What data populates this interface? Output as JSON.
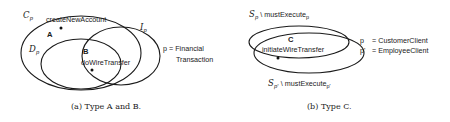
{
  "figure_a": {
    "sets": {
      "C": {
        "symbol": "C",
        "subscript": "p"
      },
      "D": {
        "symbol": "D",
        "subscript": "p"
      },
      "I": {
        "symbol": "I",
        "subscript": "p"
      }
    },
    "regions": {
      "A": {
        "label": "A",
        "element": "createNewAccount"
      },
      "B": {
        "label": "B",
        "element": "doWireTransfer"
      }
    },
    "legend": {
      "line1": "p = Financial",
      "line2": "Transaction"
    },
    "caption": "(a) Type A and B."
  },
  "figure_b": {
    "sets": {
      "top": {
        "symbol": "S",
        "subscript": "p",
        "suffix": " \\ mustExecute",
        "suffix_sub": "p"
      },
      "bottom": {
        "symbol": "S",
        "subscript": "p'",
        "suffix": " \\ mustExecute",
        "suffix_sub": "p'"
      }
    },
    "regions": {
      "C": {
        "label": "C",
        "element": "initiateWireTransfer"
      }
    },
    "legend": {
      "line1_key": "p",
      "line1_val": "= CustomerClient",
      "line2_key": "p'",
      "line2_val": "= EmployeeClient"
    },
    "caption": "(b) Type C."
  }
}
